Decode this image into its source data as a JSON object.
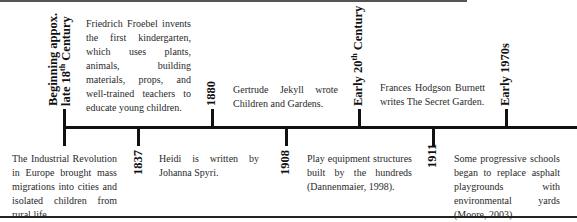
{
  "timeline": {
    "events": [
      {
        "label_line1": "Beginning appox.",
        "label_line2_pre": "late 18",
        "label_line2_sup": "th",
        "label_line2_post": " Century",
        "position": "above",
        "description": "The Industrial Revolution in Europe brought mass migrations into cities and isolated children from rural life."
      },
      {
        "label": "1837",
        "position": "below",
        "description": "Friedrich Froebel invents the first kindergarten, which uses plants, animals, building materials, props, and well-trained teachers to educate young children."
      },
      {
        "label": "1880",
        "position": "above",
        "description": "Heidi is written by Johanna Spyri."
      },
      {
        "label": "1908",
        "position": "below",
        "description": "Gertrude Jekyll wrote Children and Gardens."
      },
      {
        "label_pre": "Early 20",
        "label_sup": "th",
        "label_post": " Century",
        "position": "above",
        "description": "Play equipment structures built by the hundreds (Dannenmaier, 1998)."
      },
      {
        "label": "1911",
        "position": "below",
        "description": "Frances Hodgson Burnett writes The Secret Garden."
      },
      {
        "label": "Early 1970s",
        "position": "above",
        "description": "Some progressive schools began to replace asphalt playgrounds with environmental yards (Moore, 2003)."
      }
    ]
  }
}
